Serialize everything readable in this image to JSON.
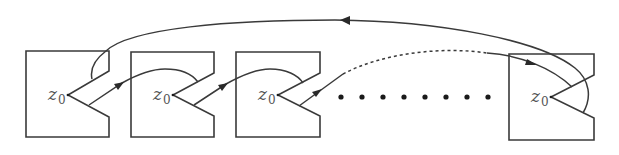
{
  "diagram": {
    "colors": {
      "stroke": "#3a3a3a",
      "background": "#ffffff",
      "label": "#555555"
    },
    "regions": [
      {
        "id": "region-1",
        "label_main": "z",
        "label_sub": "0"
      },
      {
        "id": "region-2",
        "label_main": "z",
        "label_sub": "0"
      },
      {
        "id": "region-3",
        "label_main": "z",
        "label_sub": "0"
      },
      {
        "id": "region-4",
        "label_main": "z",
        "label_sub": "0"
      }
    ],
    "ellipsis_dot_count": 8,
    "edges": [
      {
        "from": "region-1",
        "to": "region-2",
        "style": "solid",
        "arrow": true
      },
      {
        "from": "region-2",
        "to": "region-3",
        "style": "solid",
        "arrow": true
      },
      {
        "from": "region-3",
        "to": "region-4",
        "style": "dashed",
        "arrow": true
      },
      {
        "from": "region-4",
        "to": "region-1",
        "style": "solid",
        "arrow": true,
        "note": "return arc over top"
      }
    ]
  }
}
